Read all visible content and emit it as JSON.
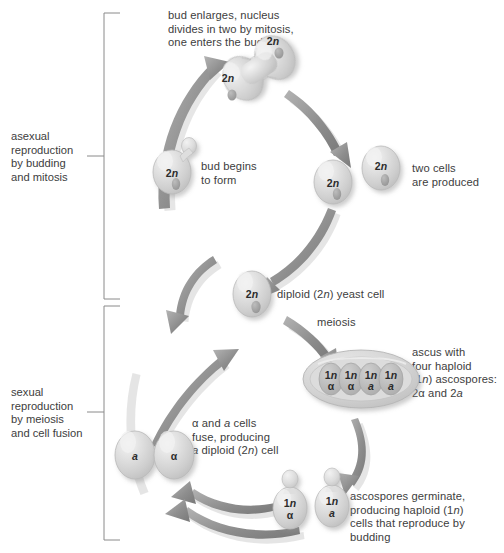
{
  "figure": {
    "colors": {
      "cell_fill": "#d9d9d9",
      "cell_fill_light": "#efefef",
      "cell_edge": "#b5b5b5",
      "nucleus": "#9a9a9a",
      "arrow": "#8c8c8c",
      "arrow_shadow": "#c9c9c9",
      "ascus_fill": "#cfcfcf",
      "text": "#3d3d3d",
      "bracket": "#8a8a8a",
      "background": "#ffffff"
    }
  },
  "brackets": [
    {
      "id": "asexual",
      "label": "asexual\nreproduction\nby budding\nand mitosis"
    },
    {
      "id": "sexual",
      "label": "sexual\nreproduction\nby meiosis\nand cell fusion"
    }
  ],
  "captions": [
    {
      "id": "bud-enlarges",
      "text": "bud enlarges, nucleus\ndivides in two by mitosis,\none enters the bud"
    },
    {
      "id": "bud-begins",
      "text": "bud begins\nto form"
    },
    {
      "id": "two-cells",
      "text": "two cells\nare produced"
    },
    {
      "id": "diploid-yeast-cell",
      "text": "diploid (2n) yeast cell",
      "italic_parts": [
        "n"
      ]
    },
    {
      "id": "meiosis",
      "text": "meiosis"
    },
    {
      "id": "ascus",
      "text": "ascus with\nfour haploid\n(1n) ascospores:\n2α and 2a"
    },
    {
      "id": "fusion",
      "text": "α and a cells\nfuse, producing\na diploid (2n) cell"
    },
    {
      "id": "germinate",
      "text": "ascospores germinate,\nproducing haploid (1n)\ncells that reproduce by\nbudding"
    }
  ],
  "cells": [
    {
      "id": "budding-cell",
      "ploidy": "2n",
      "mating_type": "",
      "stage": "bud begins to form"
    },
    {
      "id": "dividing-cell-upper",
      "ploidy": "2n",
      "mating_type": "",
      "stage": "mitosis, nucleus in bud"
    },
    {
      "id": "dividing-cell-lower",
      "ploidy": "2n",
      "mating_type": "",
      "stage": "mitosis, mother cell"
    },
    {
      "id": "daughter-cell-left",
      "ploidy": "2n",
      "mating_type": "",
      "stage": "two cells produced"
    },
    {
      "id": "daughter-cell-right",
      "ploidy": "2n",
      "mating_type": "",
      "stage": "two cells produced"
    },
    {
      "id": "diploid-cell",
      "ploidy": "2n",
      "mating_type": "",
      "stage": "diploid yeast cell"
    },
    {
      "id": "ascospore-1",
      "ploidy": "1n",
      "mating_type": "α",
      "stage": "ascospore in ascus"
    },
    {
      "id": "ascospore-2",
      "ploidy": "1n",
      "mating_type": "α",
      "stage": "ascospore in ascus"
    },
    {
      "id": "ascospore-3",
      "ploidy": "1n",
      "mating_type": "a",
      "stage": "ascospore in ascus"
    },
    {
      "id": "ascospore-4",
      "ploidy": "1n",
      "mating_type": "a",
      "stage": "ascospore in ascus"
    },
    {
      "id": "germinated-alpha",
      "ploidy": "1n",
      "mating_type": "α",
      "stage": "germinated, budding"
    },
    {
      "id": "germinated-a",
      "ploidy": "1n",
      "mating_type": "a",
      "stage": "germinated, budding"
    },
    {
      "id": "fusing-cell-a",
      "ploidy": "",
      "mating_type": "a",
      "stage": "fusing"
    },
    {
      "id": "fusing-cell-alpha",
      "ploidy": "",
      "mating_type": "α",
      "stage": "fusing"
    }
  ],
  "cell_labels": {
    "budding_cell": "2n",
    "dividing_upper": "2n",
    "dividing_lower": "2n",
    "daughter_left": "2n",
    "daughter_right": "2n",
    "diploid": "2n",
    "ascospore_1_ploidy": "1n",
    "ascospore_1_type": "α",
    "ascospore_2_ploidy": "1n",
    "ascospore_2_type": "α",
    "ascospore_3_ploidy": "1n",
    "ascospore_3_type": "a",
    "ascospore_4_ploidy": "1n",
    "ascospore_4_type": "a",
    "germinated_alpha_ploidy": "1n",
    "germinated_alpha_type": "α",
    "germinated_a_ploidy": "1n",
    "germinated_a_type": "a",
    "fusing_a": "a",
    "fusing_alpha": "α"
  }
}
